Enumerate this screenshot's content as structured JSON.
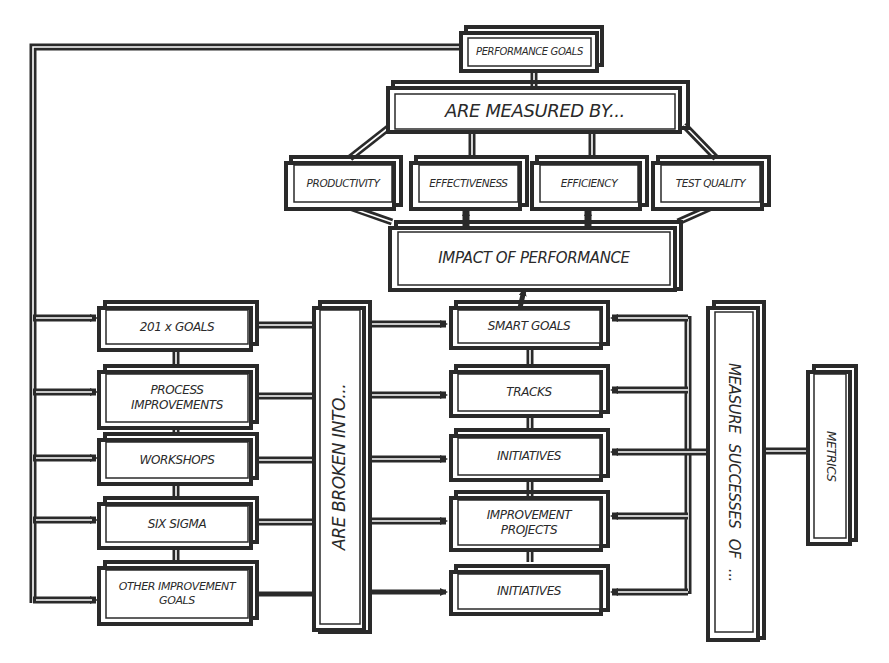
{
  "diagram": {
    "root": {
      "label": "PERFORMANCE GOALS"
    },
    "measured_by": {
      "label": "ARE MEASURED BY..."
    },
    "measures": [
      {
        "label": "PRODUCTIVITY"
      },
      {
        "label": "EFFECTIVENESS"
      },
      {
        "label": "EFFICIENCY"
      },
      {
        "label": "TEST QUALITY"
      }
    ],
    "impact": {
      "label": "IMPACT OF PERFORMANCE"
    },
    "goal_sources": [
      {
        "label": "201 x GOALS"
      },
      {
        "label": "PROCESS IMPROVEMENTS"
      },
      {
        "label": "WORKSHOPS"
      },
      {
        "label": "SIX SIGMA"
      },
      {
        "label": "OTHER IMPROVEMENT GOALS"
      }
    ],
    "broken_into": {
      "label": "ARE BROKEN INTO..."
    },
    "breakdown": [
      {
        "label": "SMART GOALS"
      },
      {
        "label": "TRACKS"
      },
      {
        "label": "INITIATIVES"
      },
      {
        "label": "IMPROVEMENT PROJECTS"
      },
      {
        "label": "INITIATIVES"
      }
    ],
    "measure_successes": {
      "label": "MEASURE SUCCESSES OF ..."
    },
    "metrics": {
      "label": "METRICS"
    },
    "colors": {
      "ink": "#2a2a2a",
      "background": "#ffffff"
    }
  }
}
